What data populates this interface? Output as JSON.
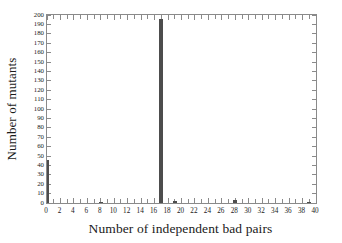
{
  "chart_data": {
    "type": "bar",
    "title": "",
    "subtitle": "",
    "xlabel": "Number of independent bad pairs",
    "ylabel": "Number of mutants",
    "xlim": [
      0,
      40
    ],
    "ylim": [
      0,
      200
    ],
    "grid": false,
    "legend": null,
    "legend_position": "none",
    "bar_color": "#4d4d4d",
    "axis_color": "#8a8a8a",
    "background_color": "#ffffff",
    "x_tick_step": 1,
    "x_label_step": 2,
    "y_tick_step": 10,
    "y_label_step": 10,
    "x_tick_labels": [
      "0",
      "2",
      "4",
      "6",
      "8",
      "10",
      "12",
      "14",
      "16",
      "18",
      "20",
      "22",
      "24",
      "26",
      "28",
      "30",
      "32",
      "34",
      "36",
      "38",
      "40"
    ],
    "y_tick_labels": [
      "0",
      "10",
      "20",
      "30",
      "40",
      "50",
      "60",
      "70",
      "80",
      "90",
      "100",
      "110",
      "120",
      "130",
      "140",
      "150",
      "160",
      "170",
      "180",
      "190",
      "200"
    ],
    "categories": [
      0,
      1,
      2,
      3,
      4,
      5,
      6,
      7,
      8,
      9,
      10,
      11,
      12,
      13,
      14,
      15,
      16,
      17,
      18,
      19,
      20,
      21,
      22,
      23,
      24,
      25,
      26,
      27,
      28,
      29,
      30,
      31,
      32,
      33,
      34,
      35,
      36,
      37,
      38,
      39,
      40
    ],
    "values": [
      46,
      0,
      0,
      0,
      0,
      0,
      0,
      0,
      1,
      0,
      0,
      0,
      0,
      0,
      0,
      0,
      0,
      196,
      0,
      2,
      0,
      0,
      0,
      0,
      0,
      0,
      0,
      0,
      3,
      0,
      0,
      0,
      0,
      0,
      0,
      0,
      0,
      0,
      0,
      1,
      0
    ],
    "nonzero_points": [
      {
        "x": 0,
        "y": 46
      },
      {
        "x": 8,
        "y": 1
      },
      {
        "x": 17,
        "y": 196
      },
      {
        "x": 19,
        "y": 2
      },
      {
        "x": 28,
        "y": 3
      },
      {
        "x": 39,
        "y": 1
      }
    ]
  }
}
